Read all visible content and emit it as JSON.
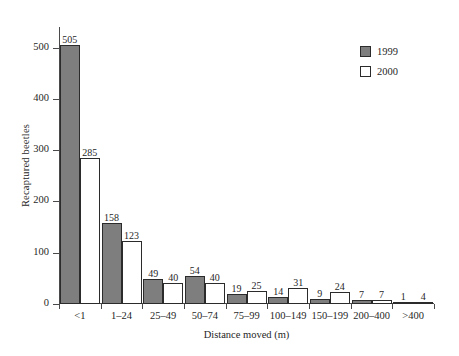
{
  "chart_data": {
    "type": "bar",
    "title": "",
    "subtitle": "",
    "xlabel": "Distance moved (m)",
    "ylabel": "Recaptured beetles",
    "categories": [
      "<1",
      "1–24",
      "25–49",
      "50–74",
      "75–99",
      "100–149",
      "150–199",
      "200–400",
      ">400"
    ],
    "series": [
      {
        "name": "1999",
        "color": "#7e7e7e",
        "values": [
          505,
          158,
          49,
          54,
          19,
          14,
          9,
          7,
          1
        ]
      },
      {
        "name": "2000",
        "color": "#ffffff",
        "values": [
          285,
          123,
          40,
          40,
          25,
          31,
          24,
          7,
          4
        ]
      }
    ],
    "ylim": [
      0,
      540
    ],
    "yticks": [
      0,
      100,
      200,
      300,
      400,
      500
    ],
    "ytick_labels": [
      "0",
      "100",
      "200",
      "300",
      "400",
      "500"
    ],
    "grid": false,
    "legend_position": "top-right",
    "data_labels": true
  },
  "legend": {
    "items": [
      {
        "label": "1999",
        "swatch": "filled-gray"
      },
      {
        "label": "2000",
        "swatch": "open-white"
      }
    ]
  }
}
